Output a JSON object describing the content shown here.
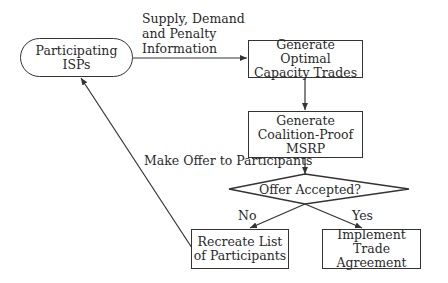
{
  "diagram": {
    "type": "flowchart",
    "nodes": {
      "participants": {
        "shape": "rounded",
        "label": "Participating ISPs"
      },
      "optimal": {
        "shape": "rect",
        "line1": "Generate Optimal",
        "line2": "Capacity Trades"
      },
      "msrp": {
        "shape": "rect",
        "line1": "Generate",
        "line2": "Coalition-Proof",
        "line3": "MSRP"
      },
      "decision": {
        "shape": "diamond",
        "label": "Offer Accepted?"
      },
      "recreate": {
        "shape": "rect",
        "line1": "Recreate List",
        "line2": "of Participants"
      },
      "implement": {
        "shape": "rect",
        "line1": "Implement Trade",
        "line2": "Agreement"
      }
    },
    "edges": {
      "supply_info": {
        "from": "participants",
        "to": "optimal",
        "line1": "Supply, Demand",
        "line2": "and Penalty",
        "line3": "Information"
      },
      "optimal_to_msrp": {
        "from": "optimal",
        "to": "msrp",
        "label": ""
      },
      "make_offer": {
        "from": "msrp",
        "to": "decision",
        "label": "Make Offer to Participants"
      },
      "no": {
        "from": "decision",
        "to": "recreate",
        "label": "No"
      },
      "yes": {
        "from": "decision",
        "to": "implement",
        "label": "Yes"
      },
      "loop_back": {
        "from": "recreate",
        "to": "participants",
        "label": ""
      }
    },
    "colors": {
      "stroke": "#333333",
      "text": "#2a2a2a",
      "background": "#ffffff"
    }
  }
}
